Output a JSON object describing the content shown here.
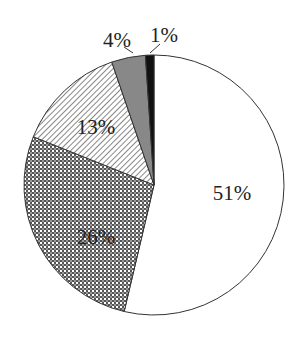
{
  "chart_data": {
    "type": "pie",
    "title": "",
    "start_angle_deg": 0,
    "direction": "clockwise",
    "slices": [
      {
        "label": "51%",
        "value": 51,
        "fill": "white",
        "pattern": "none"
      },
      {
        "label": "26%",
        "value": 26,
        "fill": "crosshatch",
        "pattern": "checker"
      },
      {
        "label": "13%",
        "value": 13,
        "fill": "diagonal-hatch",
        "pattern": "diagonal"
      },
      {
        "label": "4%",
        "value": 4,
        "fill": "#888888",
        "pattern": "solid-gray"
      },
      {
        "label": "1%",
        "value": 1,
        "fill": "#111111",
        "pattern": "solid-black"
      }
    ],
    "legend": "none",
    "labels_inside": [
      "51%",
      "26%",
      "13%"
    ],
    "labels_outside_with_leader": [
      "4%",
      "1%"
    ]
  },
  "colors": {
    "outline": "#333333",
    "gray_slice": "#888888",
    "black_slice": "#111111",
    "hatch_stroke": "#555555",
    "background": "#ffffff"
  }
}
